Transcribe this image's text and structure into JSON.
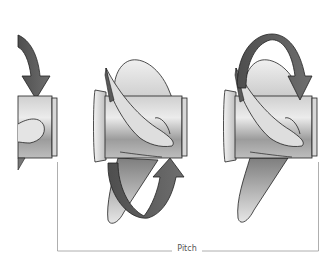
{
  "diagram": {
    "label": "Pitch",
    "colors": {
      "background": "#ffffff",
      "outline": "#222222",
      "arrow": "#5a5a5a",
      "arrow_dark": "#4a4a4a",
      "hub_light": "#e6e6e6",
      "hub_dark": "#8a8a8a",
      "blade_light": "#e8e8e8",
      "blade_dark": "#8c8c8c",
      "bracket": "#9a9a9a"
    },
    "propellers": [
      {
        "id": "left",
        "state": "partially cropped, arrow rotating down"
      },
      {
        "id": "middle",
        "state": "arrow rotating up from bottom"
      },
      {
        "id": "right",
        "state": "arrow rotating over top and down"
      }
    ]
  }
}
